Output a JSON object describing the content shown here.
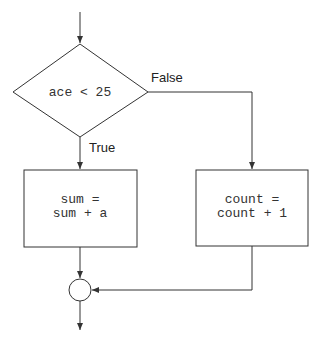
{
  "diagram": {
    "type": "flowchart",
    "decision": {
      "condition": "ace < 25"
    },
    "branches": {
      "true_label": "True",
      "false_label": "False"
    },
    "true_box": {
      "line1": "sum =",
      "line2": "sum + a"
    },
    "false_box": {
      "line1": "count =",
      "line2": "count + 1"
    },
    "join": {
      "shape": "circle"
    },
    "colors": {
      "line": "#333333",
      "background": "#ffffff"
    }
  }
}
